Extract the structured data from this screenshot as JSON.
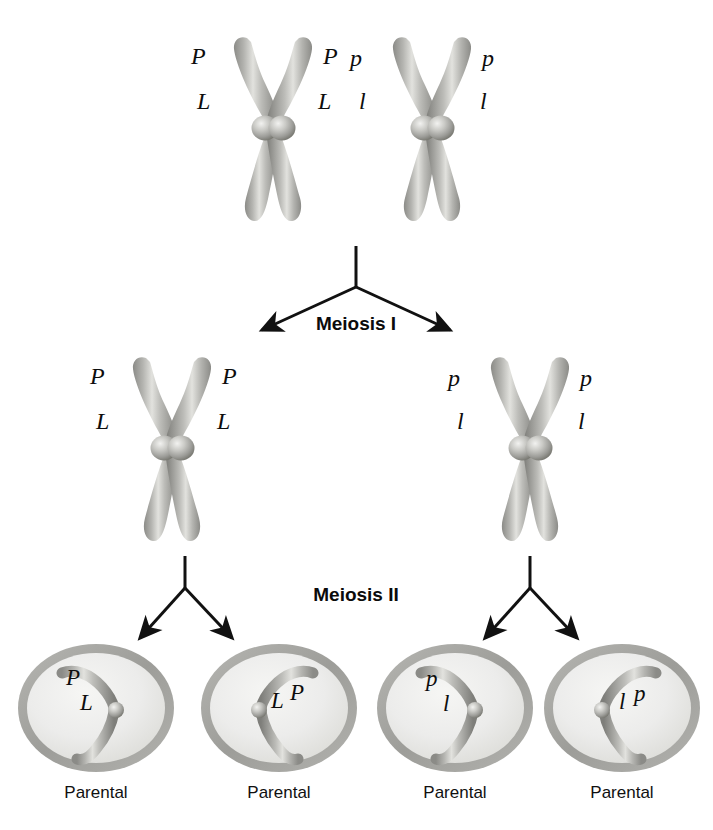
{
  "figure": {
    "background_color": "#ffffff",
    "chromosome_color": "#9a9a96",
    "chromosome_highlight": "#d8d8d4",
    "chromosome_shadow": "#6e6e6a",
    "membrane_color": "#a8a8a4",
    "cytoplasm_color": "#ececea",
    "arrow_color": "#111111",
    "text_color": "#0d0d0d"
  },
  "stages": {
    "meiosis_one_label": "Meiosis I",
    "meiosis_two_label": "Meiosis II"
  },
  "top_row": {
    "chromosomes": [
      {
        "id": "top-left-tetrad",
        "alleles": [
          {
            "text": "P",
            "side": "left",
            "position": "upper"
          },
          {
            "text": "P",
            "side": "right",
            "position": "upper"
          },
          {
            "text": "L",
            "side": "left",
            "position": "lower"
          },
          {
            "text": "L",
            "side": "right",
            "position": "lower"
          }
        ]
      },
      {
        "id": "top-right-tetrad",
        "alleles": [
          {
            "text": "p",
            "side": "left",
            "position": "upper"
          },
          {
            "text": "p",
            "side": "right",
            "position": "upper"
          },
          {
            "text": "l",
            "side": "left",
            "position": "lower"
          },
          {
            "text": "l",
            "side": "right",
            "position": "lower"
          }
        ]
      }
    ]
  },
  "middle_row": {
    "chromosomes": [
      {
        "id": "middle-left-dyad",
        "alleles": [
          {
            "text": "P",
            "side": "left",
            "position": "upper"
          },
          {
            "text": "P",
            "side": "right",
            "position": "upper"
          },
          {
            "text": "L",
            "side": "left",
            "position": "lower"
          },
          {
            "text": "L",
            "side": "right",
            "position": "lower"
          }
        ]
      },
      {
        "id": "middle-right-dyad",
        "alleles": [
          {
            "text": "p",
            "side": "left",
            "position": "upper"
          },
          {
            "text": "p",
            "side": "right",
            "position": "upper"
          },
          {
            "text": "l",
            "side": "left",
            "position": "lower"
          },
          {
            "text": "l",
            "side": "right",
            "position": "lower"
          }
        ]
      }
    ]
  },
  "gametes": [
    {
      "id": "gamete-1",
      "caption": "Parental",
      "allele_top": "P",
      "allele_bottom": "L",
      "orientation": "left"
    },
    {
      "id": "gamete-2",
      "caption": "Parental",
      "allele_top": "L",
      "allele_bottom": "P",
      "orientation": "right"
    },
    {
      "id": "gamete-3",
      "caption": "Parental",
      "allele_top": "p",
      "allele_bottom": "l",
      "orientation": "left"
    },
    {
      "id": "gamete-4",
      "caption": "Parental",
      "allele_top": "l",
      "allele_bottom": "p",
      "orientation": "right"
    }
  ]
}
